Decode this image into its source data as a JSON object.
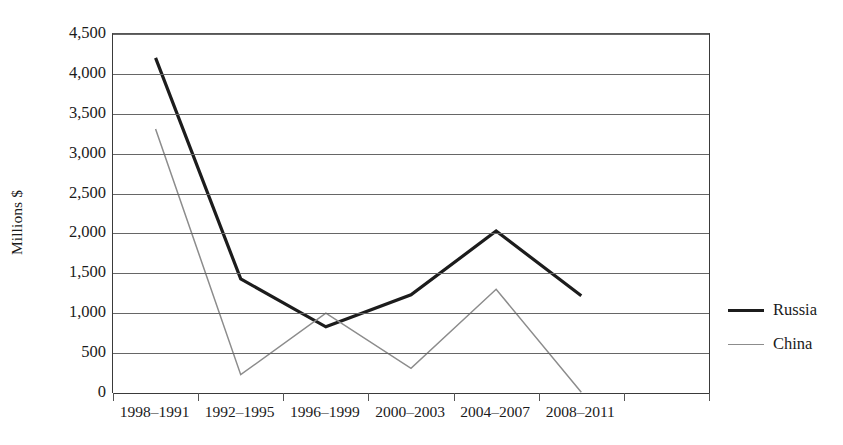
{
  "chart_data": {
    "type": "line",
    "title": "",
    "xlabel": "",
    "ylabel": "Millions $",
    "ylim": [
      0,
      4500
    ],
    "ytick_step": 500,
    "yticks": [
      4500,
      4000,
      3500,
      3000,
      2500,
      2000,
      1500,
      1000,
      500,
      0
    ],
    "ytick_labels": [
      "4,500",
      "4,000",
      "3,500",
      "3,000",
      "2,500",
      "2,000",
      "1,500",
      "1,000",
      "500",
      "0"
    ],
    "grid": "horizontal",
    "legend_position": "right",
    "categories": [
      "1998–1991",
      "1992–1995",
      "1996–1999",
      "2000–2003",
      "2004–2007",
      "2008–2011"
    ],
    "series": [
      {
        "name": "Russia",
        "color": "#1c1c1c",
        "line_width": 3.2,
        "values": [
          4200,
          1430,
          830,
          1230,
          2030,
          1220
        ]
      },
      {
        "name": "China",
        "color": "#8c8c8c",
        "line_width": 1.5,
        "values": [
          3310,
          230,
          1000,
          310,
          1300,
          10
        ]
      }
    ]
  },
  "axis": {
    "y_title": "Millions $"
  },
  "legend": {
    "entries": [
      {
        "label": "Russia",
        "swatch": "thick-black-line"
      },
      {
        "label": "China",
        "swatch": "thin-gray-line"
      }
    ]
  }
}
